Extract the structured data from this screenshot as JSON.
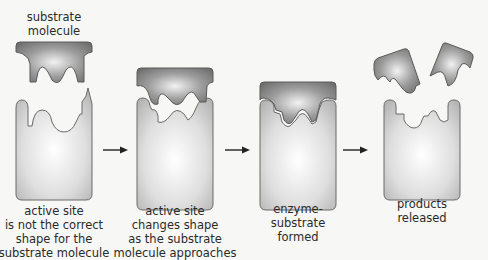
{
  "title_label": {
    "lines": [
      "substrate",
      "molecule"
    ]
  },
  "panels": [
    {
      "caption": [
        "active site",
        "is not the correct",
        "shape for the",
        "substrate molecule"
      ]
    },
    {
      "caption": [
        "active site",
        "changes shape",
        "as the substrate",
        "molecule approaches"
      ]
    },
    {
      "caption": [
        "enzyme-",
        "substrate",
        "formed"
      ]
    },
    {
      "caption": [
        "products",
        "released"
      ]
    }
  ],
  "arrows": [
    "arrow-1-to-2",
    "arrow-2-to-3",
    "arrow-3-to-4"
  ],
  "colors": {
    "background": "#f7f7f5",
    "enzyme_fill_light": "#f4f4f4",
    "enzyme_fill_dark": "#b8b8b8",
    "substrate_fill_light": "#e6e6e6",
    "substrate_fill_dark": "#7a7a7a",
    "outline": "#6a6a6a",
    "text": "#2a2a2a"
  }
}
